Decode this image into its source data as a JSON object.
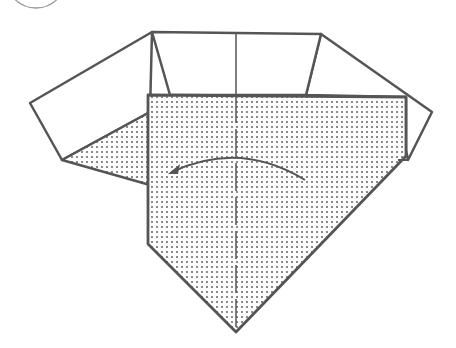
{
  "diagram": {
    "type": "origami-instruction-step",
    "step_marker": {
      "shape": "circle",
      "partially_visible": true,
      "label": ""
    },
    "colors": {
      "line": "#555555",
      "paper_front": "#ffffff",
      "paper_back_dot": "#8a8a8a",
      "background": "#ffffff"
    },
    "elements": {
      "back_panel": "white top panel (trapezoid)",
      "left_flap": "white left wing",
      "right_flap": "white right wing",
      "front_flap": "dotted/shaded pentagon pointing down",
      "left_triangle": "dotted triangle under left wing",
      "center_line": "vertical valley fold line (solid above, dashed below)",
      "fold_arrow": "curved arrow pointing left"
    }
  }
}
